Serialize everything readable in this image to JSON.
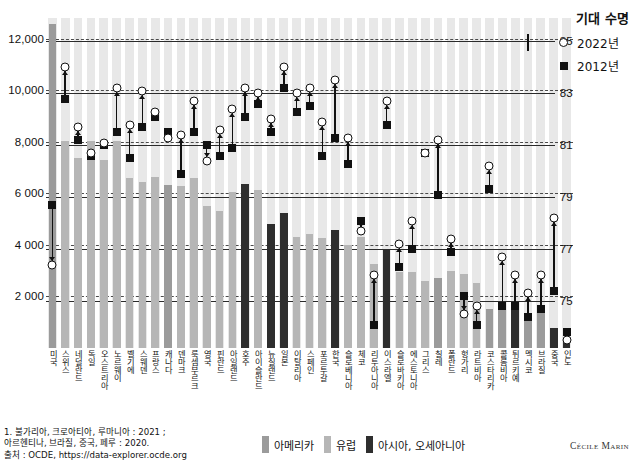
{
  "legend_top": {
    "title": "기대 수명",
    "items": [
      {
        "marker": "circle-marker",
        "label": "2022년"
      },
      {
        "marker": "square-marker",
        "label": "2012년"
      }
    ]
  },
  "legend_bottom": {
    "items": [
      {
        "key": "americas",
        "label": "아메리카",
        "color": "#9b9b9b"
      },
      {
        "key": "europe",
        "label": "유럽",
        "color": "#b6b6b6"
      },
      {
        "key": "asia",
        "label": "아시아, 오세아니아",
        "color": "#2e2e2e"
      }
    ]
  },
  "footnote": "1. 불가리아, 크로아티아, 루마니아 : 2021 ;\n아르헨티나, 브라질, 중국, 페루 : 2020.\n출처 : OCDE, https://data-explorer.ocde.org",
  "credit": "Cécile Marin",
  "chart_data": {
    "type": "bar",
    "title": "",
    "xlabel": "",
    "ylabel": "",
    "ylim": [
      0,
      12800
    ],
    "y_right_lim": [
      73.2,
      85.9
    ],
    "grid": true,
    "legend_position": "top-right",
    "y_ticks_left": [
      "12,000",
      "10,000",
      "8,000",
      "6 000",
      "4 000",
      "2 000"
    ],
    "y_tick_values_left": [
      12000,
      10000,
      8000,
      6000,
      4000,
      2000
    ],
    "y_ticks_right": [
      "85",
      "83",
      "81",
      "79",
      "77",
      "75"
    ],
    "y_tick_values_right": [
      85,
      83,
      81,
      79,
      77,
      75
    ],
    "series": [
      {
        "name": "지출",
        "type": "bar",
        "unit": "USD PPP"
      },
      {
        "name": "2022년",
        "type": "scatter",
        "marker": "circle",
        "axis": "right"
      },
      {
        "name": "2012년",
        "type": "scatter",
        "marker": "square",
        "axis": "right"
      }
    ],
    "categories": [
      "미국",
      "스위스",
      "네덜란드",
      "독일",
      "오스트리아",
      "노르웨이",
      "벨기에",
      "스웨덴",
      "프랑스",
      "캐나다",
      "덴마크",
      "룩셈부르크",
      "영국",
      "핀란드",
      "아일랜드",
      "호주",
      "아이슬란드",
      "뉴질랜드",
      "일본",
      "이탈리아",
      "스페인",
      "포르투갈",
      "한국",
      "슬로베니아",
      "체코",
      "리투아니아",
      "이스라엘",
      "슬로바키아",
      "에스토니아",
      "그리스",
      "칠레",
      "폴란드",
      "헝가리",
      "라트비아",
      "코스타리카",
      "콜롬비아",
      "튀르키예",
      "멕시코",
      "브라질",
      "중국",
      "인도"
    ],
    "values": [
      12555,
      8049,
      7358,
      8011,
      7275,
      8043,
      6600,
      6438,
      6630,
      6319,
      6280,
      6600,
      5493,
      5299,
      6047,
      6350,
      6125,
      4800,
      5251,
      4291,
      4432,
      4268,
      4570,
      4010,
      4288,
      3270,
      3820,
      2960,
      2950,
      2580,
      2725,
      2970,
      2860,
      2520,
      1500,
      1800,
      1500,
      1180,
      1520,
      760,
      280
    ],
    "values_2022_life": [
      76.4,
      84.0,
      81.7,
      80.7,
      81.1,
      83.2,
      81.8,
      83.1,
      82.3,
      81.3,
      81.4,
      82.7,
      80.4,
      81.6,
      82.4,
      83.2,
      83.0,
      82.0,
      84.0,
      83.0,
      83.2,
      81.9,
      83.5,
      81.3,
      77.7,
      76.0,
      82.7,
      77.2,
      78.1,
      80.7,
      81.2,
      77.4,
      74.5,
      74.8,
      80.2,
      76.7,
      76.0,
      75.3,
      76.0,
      78.2,
      73.5
    ],
    "values_2012_life": [
      78.7,
      82.8,
      81.2,
      80.6,
      81.0,
      81.5,
      80.5,
      81.7,
      82.1,
      81.5,
      79.9,
      81.5,
      81.0,
      80.6,
      80.9,
      82.1,
      82.6,
      81.5,
      83.2,
      82.3,
      82.5,
      80.6,
      81.3,
      80.3,
      78.1,
      74.1,
      81.8,
      76.3,
      77.0,
      80.7,
      79.1,
      76.9,
      75.2,
      74.1,
      79.3,
      74.8,
      74.8,
      74.4,
      74.7,
      75.4,
      73.8
    ],
    "regions": [
      "americas",
      "europe",
      "europe",
      "europe",
      "europe",
      "europe",
      "europe",
      "europe",
      "europe",
      "americas",
      "europe",
      "europe",
      "europe",
      "europe",
      "europe",
      "asia",
      "europe",
      "asia",
      "asia",
      "europe",
      "europe",
      "europe",
      "asia",
      "europe",
      "europe",
      "europe",
      "asia",
      "europe",
      "europe",
      "europe",
      "americas",
      "europe",
      "europe",
      "europe",
      "americas",
      "americas",
      "asia",
      "americas",
      "americas",
      "asia",
      "asia"
    ]
  }
}
